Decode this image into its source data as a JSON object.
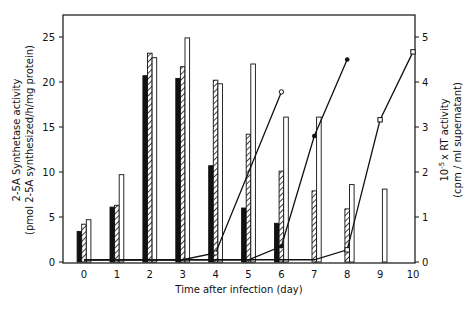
{
  "chart_data": {
    "type": "bar",
    "title": "",
    "xlabel": "Time after infection (day)",
    "ylabel": "2-5A Synthetase activity (pmol 2-5A synthesized/h/mg protein)",
    "ylabel_line1": "2-5A Synthetase activity",
    "ylabel_line2": "(pmol 2-5A synthesized/h/mg protein)",
    "y2label": "10^-5 x RT activity (cpm/ml supernatant)",
    "y2label_line1": "10",
    "y2label_sup": "-5",
    "y2label_line1_rest": "x RT activity",
    "y2label_line2": "(cpm / ml supernatant)",
    "ylim": [
      0,
      27.5
    ],
    "y2lim": [
      0,
      5.5
    ],
    "yticks": [
      0,
      5,
      10,
      15,
      20,
      25
    ],
    "y2ticks": [
      0,
      1,
      2,
      3,
      4,
      5
    ],
    "categories": [
      "0",
      "1",
      "2",
      "3",
      "4",
      "5",
      "6",
      "7",
      "8",
      "9",
      "10"
    ],
    "grid": false,
    "legend": null,
    "bar_series": [
      {
        "name": "black bars (2-5A synthetase)",
        "fill": "solid-black",
        "values": [
          3.4,
          6.1,
          20.7,
          20.4,
          10.7,
          6.0,
          4.3,
          null,
          null,
          null,
          null
        ]
      },
      {
        "name": "hatched bars (2-5A synthetase)",
        "fill": "hatched",
        "values": [
          4.2,
          6.3,
          23.2,
          21.7,
          20.2,
          14.2,
          10.1,
          7.9,
          5.9,
          null,
          null
        ]
      },
      {
        "name": "open bars (2-5A synthetase)",
        "fill": "white",
        "values": [
          4.7,
          9.7,
          22.7,
          24.9,
          19.8,
          22.0,
          16.1,
          16.1,
          8.6,
          8.1,
          null
        ]
      }
    ],
    "line_series": [
      {
        "name": "RT activity (open circles)",
        "marker": "open-circle",
        "axis": "right",
        "x": [
          0,
          1,
          2,
          3,
          4,
          6
        ],
        "values": [
          0.05,
          0.05,
          0.05,
          0.05,
          0.2,
          3.78
        ]
      },
      {
        "name": "RT activity (filled circles)",
        "marker": "filled-circle",
        "axis": "right",
        "x": [
          0,
          1,
          2,
          3,
          4,
          5,
          6,
          7,
          8
        ],
        "values": [
          0.05,
          0.05,
          0.05,
          0.05,
          0.05,
          0.05,
          0.35,
          2.8,
          4.5
        ]
      },
      {
        "name": "RT activity (open squares)",
        "marker": "open-square",
        "axis": "right",
        "x": [
          0,
          1,
          2,
          3,
          4,
          5,
          6,
          7,
          8,
          9,
          10
        ],
        "values": [
          0.05,
          0.05,
          0.05,
          0.05,
          0.05,
          0.05,
          0.05,
          0.05,
          0.27,
          3.16,
          4.67
        ]
      }
    ]
  }
}
